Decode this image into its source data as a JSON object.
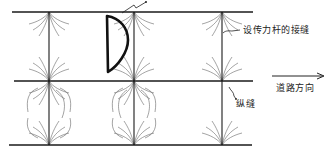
{
  "diagram": {
    "type": "pavement-slab-joint-layout",
    "colors": {
      "line": "#1a1a1a",
      "hatch": "#555555",
      "background": "#ffffff"
    },
    "horizontal_joints": [
      {
        "y": 12,
        "x1": 12,
        "x2": 253
      },
      {
        "y": 81,
        "x1": 14,
        "x2": 253
      },
      {
        "y": 145,
        "x1": 9,
        "x2": 252
      }
    ],
    "vertical_joints": [
      {
        "x": 49,
        "y1": 12,
        "y2": 145
      },
      {
        "x": 134,
        "y1": 12,
        "y2": 145
      },
      {
        "x": 222,
        "y1": 12,
        "y2": 145
      }
    ],
    "labels": {
      "dowel_joint": "设传力杆的接缝",
      "road_direction": "道路方向",
      "longitudinal_joint": "纵缝"
    },
    "arrow": {
      "x1": 272,
      "x2": 324,
      "y": 76,
      "semantic": "road-direction-arrow"
    },
    "d_crack": {
      "semantic": "semicircular-corner-crack"
    }
  }
}
